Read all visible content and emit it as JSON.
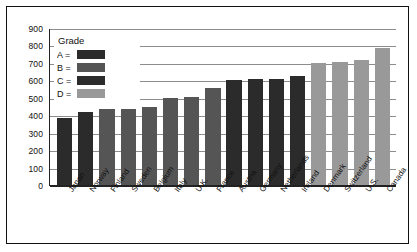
{
  "chart_data": {
    "type": "bar",
    "title": "",
    "xlabel": "",
    "ylabel": "",
    "ylim": [
      0,
      900
    ],
    "ytick_values": [
      900,
      800,
      700,
      600,
      500,
      400,
      300,
      200,
      100,
      0
    ],
    "ytick_labels": [
      "900",
      "800",
      "700",
      "600",
      "500",
      "400",
      "300",
      "200",
      "100",
      "0"
    ],
    "grid": true,
    "legend_position": "top-left",
    "categories": [
      "Japan",
      "Norway",
      "Finland",
      "Sweden",
      "Belgium",
      "Italy",
      "U.K.",
      "France",
      "Austria",
      "Germany",
      "Netherlands",
      "Ireland",
      "Denmark",
      "Switzerland",
      "U.S.",
      "Canada"
    ],
    "values": [
      385,
      420,
      435,
      437,
      445,
      500,
      505,
      555,
      600,
      605,
      608,
      625,
      700,
      705,
      715,
      785
    ],
    "bar_colors": [
      "#2b2b2b",
      "#2b2b2b",
      "#555555",
      "#555555",
      "#555555",
      "#555555",
      "#555555",
      "#555555",
      "#2b2b2b",
      "#2b2b2b",
      "#2b2b2b",
      "#2b2b2b",
      "#999999",
      "#999999",
      "#999999",
      "#999999"
    ]
  },
  "legend": {
    "title": "Grade",
    "items": [
      {
        "key": "A =",
        "color": "#2b2b2b"
      },
      {
        "key": "B =",
        "color": "#555555"
      },
      {
        "key": "C =",
        "color": "#2b2b2b"
      },
      {
        "key": "D =",
        "color": "#999999"
      }
    ]
  }
}
